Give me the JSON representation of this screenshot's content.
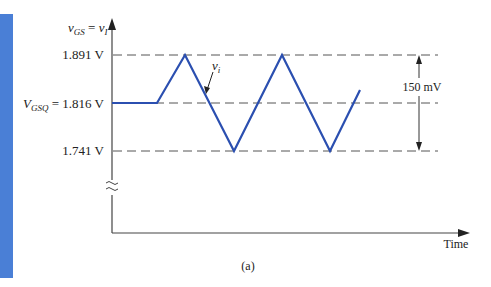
{
  "figure": {
    "caption": "(a)",
    "accent_bar_color": "#4a7fd6",
    "waveform_color": "#2b4fb0",
    "y_axis_label": {
      "main": "v",
      "sub1": "GS",
      "eq": " = ",
      "main2": "v",
      "sub2": "I"
    },
    "x_axis_label": "Time",
    "levels": [
      {
        "name": "max",
        "label": "1.891 V",
        "value": 1.891
      },
      {
        "name": "quiescent",
        "label_prefix": "V",
        "label_sub": "GSQ",
        "label": " = 1.816 V",
        "value": 1.816
      },
      {
        "name": "min",
        "label": "1.741 V",
        "value": 1.741
      }
    ],
    "signal_label": {
      "main": "v",
      "sub": "i"
    },
    "amplitude_annotation": "150 mV"
  }
}
